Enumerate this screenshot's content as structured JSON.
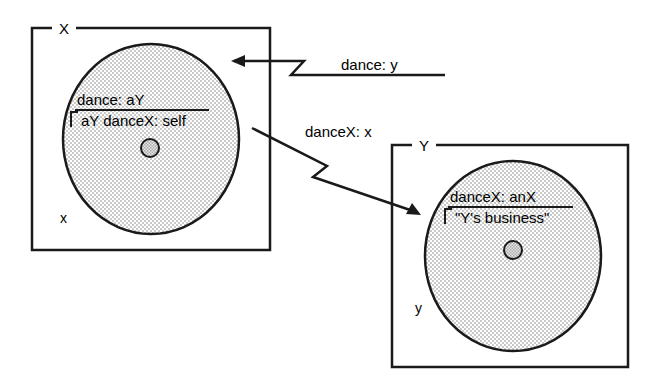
{
  "diagram": {
    "colors": {
      "stroke": "#1a1a1a",
      "circle_fill": "#d9d9d9",
      "dot_fill": "#c4c4c4",
      "background": "#ffffff"
    },
    "objects": [
      {
        "id": "x-object",
        "box_label": "X",
        "instance_label": "x",
        "method_selector": "dance: aY",
        "method_body_return": "aY danceX: self",
        "return_symbol": "↑"
      },
      {
        "id": "y-object",
        "box_label": "Y",
        "instance_label": "y",
        "method_selector": "danceX: anX",
        "method_body_return": "\"Y's business\"",
        "return_symbol": "↑"
      }
    ],
    "messages": [
      {
        "id": "incoming-message",
        "label": "dance: y",
        "direction": "into-x",
        "style": "zigzag-arrow"
      },
      {
        "id": "x-to-y-message",
        "label": "danceX: x",
        "direction": "x-to-y",
        "style": "zigzag-arrow"
      }
    ]
  }
}
